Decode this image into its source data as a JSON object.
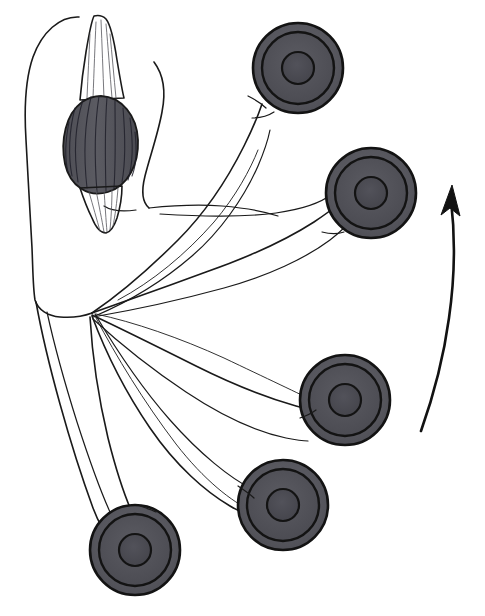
{
  "figure": {
    "title": "Muscle spindle with motor end plates",
    "caption": "",
    "width": 485,
    "height": 616,
    "background_color": "#ffffff",
    "ink_color": "#1a1a1a",
    "style": "black-and-white scientific line drawing with gray shaded fills"
  },
  "palette": {
    "ink": "#1a1a1a",
    "disc_outline": "#131313",
    "disc_outer_fill": "#5a5a5f",
    "disc_middle_fill": "#4f4f55",
    "disc_core_fill": "#48484e",
    "spindle_fill": "#56565c",
    "spindle_striation": "#20202a",
    "paper": "#ffffff"
  },
  "spindle": {
    "label": "muscle-spindle",
    "center_x": 100,
    "center_y": 128,
    "width": 72,
    "height": 106,
    "fill": "#56565c",
    "striation_count": 11,
    "upper_tail": "tapering striated pole extending to top of frame",
    "lower_tail": "tapering striated pole extending downward"
  },
  "convergence": {
    "label": "nerve-fiber-convergence-point",
    "x": 92,
    "y": 313
  },
  "discs": [
    {
      "id": "disc-1",
      "label": "motor-end-plate-1",
      "cx": 298,
      "cy": 68,
      "r_outer": 45,
      "r_mid": 36,
      "r_core": 16,
      "position_note": "top, upper right"
    },
    {
      "id": "disc-2",
      "label": "motor-end-plate-2",
      "cx": 371,
      "cy": 193,
      "r_outer": 45,
      "r_mid": 36,
      "r_core": 16,
      "position_note": "upper right"
    },
    {
      "id": "disc-3",
      "label": "motor-end-plate-3",
      "cx": 345,
      "cy": 400,
      "r_outer": 45,
      "r_mid": 36,
      "r_core": 16,
      "position_note": "lower right"
    },
    {
      "id": "disc-4",
      "label": "motor-end-plate-4",
      "cx": 283,
      "cy": 505,
      "r_outer": 45,
      "r_mid": 36,
      "r_core": 16,
      "position_note": "bottom center"
    },
    {
      "id": "disc-5",
      "label": "motor-end-plate-5",
      "cx": 135,
      "cy": 550,
      "r_outer": 45,
      "r_mid": 36,
      "r_core": 16,
      "position_note": "bottom left"
    }
  ],
  "arrow": {
    "label": "rotation-direction-arrow",
    "color": "#121212",
    "direction": "upward",
    "start_x": 421,
    "start_y": 430,
    "tip_x": 452,
    "tip_y": 186,
    "curve_note": "clockwise arc along right margin, arrowhead at top"
  },
  "fibers": [
    {
      "id": "fiber-1",
      "target": "disc-1",
      "note": "long fiber to top disc"
    },
    {
      "id": "fiber-2",
      "target": "disc-2",
      "note": "fiber to upper-right disc"
    },
    {
      "id": "fiber-3",
      "target": "disc-3",
      "note": "fiber to lower-right disc"
    },
    {
      "id": "fiber-4",
      "target": "disc-4",
      "note": "fiber to bottom-center disc"
    },
    {
      "id": "fiber-5",
      "target": "disc-5",
      "note": "fiber to bottom-left disc"
    }
  ],
  "outline": {
    "label": "muscle-belly-outline",
    "note": "large rounded contour enclosing spindle on the left side of frame"
  }
}
